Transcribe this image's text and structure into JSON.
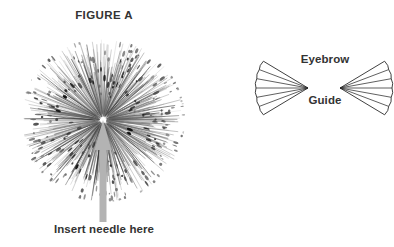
{
  "canvas": {
    "width": 394,
    "height": 247,
    "background": "#ffffff"
  },
  "colors": {
    "text": "#333333",
    "arrow": "#b3b3b3",
    "outline": "#2b2b2b",
    "seed_dark": "#1a1a1a",
    "seed_mid": "#777777"
  },
  "figure": {
    "title": "FIGURE A",
    "caption": "Insert needle here",
    "center": {
      "x": 103,
      "y": 120
    },
    "radius": 80
  },
  "arrow": {
    "name": "insert-needle-arrow",
    "color": "#b3b3b3",
    "tip": {
      "x": 103,
      "y": 120
    },
    "tail": {
      "x": 103,
      "y": 222
    },
    "shaft_width": 7,
    "head_width": 17,
    "head_height": 30,
    "direction": "up"
  },
  "eyebrow_guide": {
    "title_lines": [
      "Eyebrow",
      "Guide"
    ],
    "left_fan": {
      "name": "eyebrow-guide-left-fan",
      "apex": {
        "x": 308,
        "y": 88
      },
      "segments": 6,
      "orientation": "apex-right"
    },
    "right_fan": {
      "name": "eyebrow-guide-right-fan",
      "apex": {
        "x": 340,
        "y": 88
      },
      "segments": 6,
      "orientation": "apex-left"
    }
  },
  "icons": {
    "dandelion": "dandelion-icon",
    "arrow_up": "arrow-up-icon",
    "fan_left": "fan-left-icon",
    "fan_right": "fan-right-icon"
  }
}
